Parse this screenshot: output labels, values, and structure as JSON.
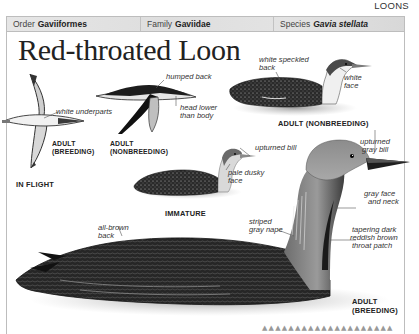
{
  "section_label": "LOONS",
  "header_bar": {
    "order": {
      "label": "Order",
      "value": "Gaviiformes"
    },
    "family": {
      "label": "Family",
      "value": "Gaviidae"
    },
    "species": {
      "label": "Species",
      "value": "Gavia stellata"
    }
  },
  "title": "Red-throated Loon",
  "figures": {
    "in_flight": {
      "caption": "IN FLIGHT",
      "breeding": {
        "caption_line1": "ADULT",
        "caption_line2": "(BREEDING)",
        "labels": [
          "white underparts"
        ]
      },
      "nonbreeding": {
        "caption_line1": "ADULT",
        "caption_line2": "(NONBREEDING)",
        "labels": [
          "humped back",
          "head lower",
          "than body"
        ]
      }
    },
    "adult_nonbreeding": {
      "caption": "ADULT (NONBREEDING)",
      "labels": [
        "white speckled",
        "back",
        "white",
        "face"
      ]
    },
    "immature": {
      "caption": "IMMATURE",
      "labels": [
        "upturned bill",
        "pale dusky",
        "face"
      ]
    },
    "adult_breeding": {
      "caption_line1": "ADULT",
      "caption_line2": "(BREEDING)",
      "labels": {
        "upturned_gray_bill": [
          "upturned",
          "gray bill"
        ],
        "gray_face_neck": [
          "gray face",
          "and neck"
        ],
        "throat_patch": [
          "tapering dark",
          "reddish brown",
          "throat patch"
        ],
        "striped_nape": [
          "striped",
          "gray nape"
        ],
        "all_brown_back": [
          "all-brown",
          "back"
        ]
      }
    }
  },
  "footer_ticks": "▲▲▲▲▲▲▲▲▲▲▲▲▲▲▲▲▲▲▲▲"
}
